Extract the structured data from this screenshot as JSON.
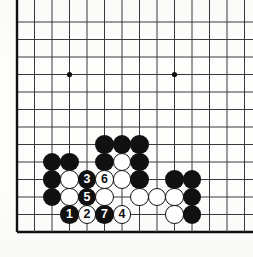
{
  "diagram": {
    "type": "go-board-problem",
    "board": {
      "origin_x": 17.0,
      "origin_y": 22.0,
      "spacing": 17.5,
      "cols": 13,
      "rows": 13,
      "edges": {
        "left": true,
        "bottom": true,
        "top": false,
        "right": false
      },
      "line_color": "#3a3a3a",
      "edge_color": "#111111",
      "background": "#fdfdfc",
      "stone_radius": 9.2
    },
    "star_points": [
      {
        "col": 4,
        "row": 4
      },
      {
        "col": 10,
        "row": 4
      },
      {
        "col": 10,
        "row": 10
      }
    ],
    "stones": [
      {
        "col": 3,
        "row": 9,
        "color": "black",
        "label": ""
      },
      {
        "col": 4,
        "row": 9,
        "color": "black",
        "label": ""
      },
      {
        "col": 3,
        "row": 10,
        "color": "black",
        "label": ""
      },
      {
        "col": 4,
        "row": 10,
        "color": "white",
        "label": ""
      },
      {
        "col": 3,
        "row": 11,
        "color": "black",
        "label": ""
      },
      {
        "col": 4,
        "row": 11,
        "color": "white",
        "label": ""
      },
      {
        "col": 6,
        "row": 8,
        "color": "black",
        "label": ""
      },
      {
        "col": 7,
        "row": 8,
        "color": "black",
        "label": ""
      },
      {
        "col": 8,
        "row": 8,
        "color": "black",
        "label": ""
      },
      {
        "col": 6,
        "row": 9,
        "color": "black",
        "label": ""
      },
      {
        "col": 7,
        "row": 9,
        "color": "white",
        "label": ""
      },
      {
        "col": 8,
        "row": 9,
        "color": "black",
        "label": ""
      },
      {
        "col": 5,
        "row": 10,
        "color": "black",
        "label": "3"
      },
      {
        "col": 6,
        "row": 10,
        "color": "white",
        "label": "6"
      },
      {
        "col": 7,
        "row": 10,
        "color": "white",
        "label": ""
      },
      {
        "col": 8,
        "row": 10,
        "color": "black",
        "label": ""
      },
      {
        "col": 5,
        "row": 11,
        "color": "black",
        "label": "5"
      },
      {
        "col": 6,
        "row": 11,
        "color": "white",
        "label": ""
      },
      {
        "col": 8,
        "row": 11,
        "color": "white",
        "label": ""
      },
      {
        "col": 9,
        "row": 11,
        "color": "white",
        "label": ""
      },
      {
        "col": 4,
        "row": 12,
        "color": "black",
        "label": "1"
      },
      {
        "col": 5,
        "row": 12,
        "color": "white",
        "label": "2"
      },
      {
        "col": 6,
        "row": 12,
        "color": "black",
        "label": "7"
      },
      {
        "col": 7,
        "row": 12,
        "color": "white",
        "label": "4"
      },
      {
        "col": 10,
        "row": 10,
        "color": "black",
        "label": ""
      },
      {
        "col": 11,
        "row": 10,
        "color": "black",
        "label": ""
      },
      {
        "col": 10,
        "row": 11,
        "color": "white",
        "label": ""
      },
      {
        "col": 11,
        "row": 11,
        "color": "black",
        "label": ""
      },
      {
        "col": 10,
        "row": 12,
        "color": "white",
        "label": ""
      },
      {
        "col": 11,
        "row": 12,
        "color": "black",
        "label": ""
      }
    ],
    "move_sequence": [
      "1",
      "2",
      "3",
      "4",
      "5",
      "6",
      "7"
    ]
  }
}
